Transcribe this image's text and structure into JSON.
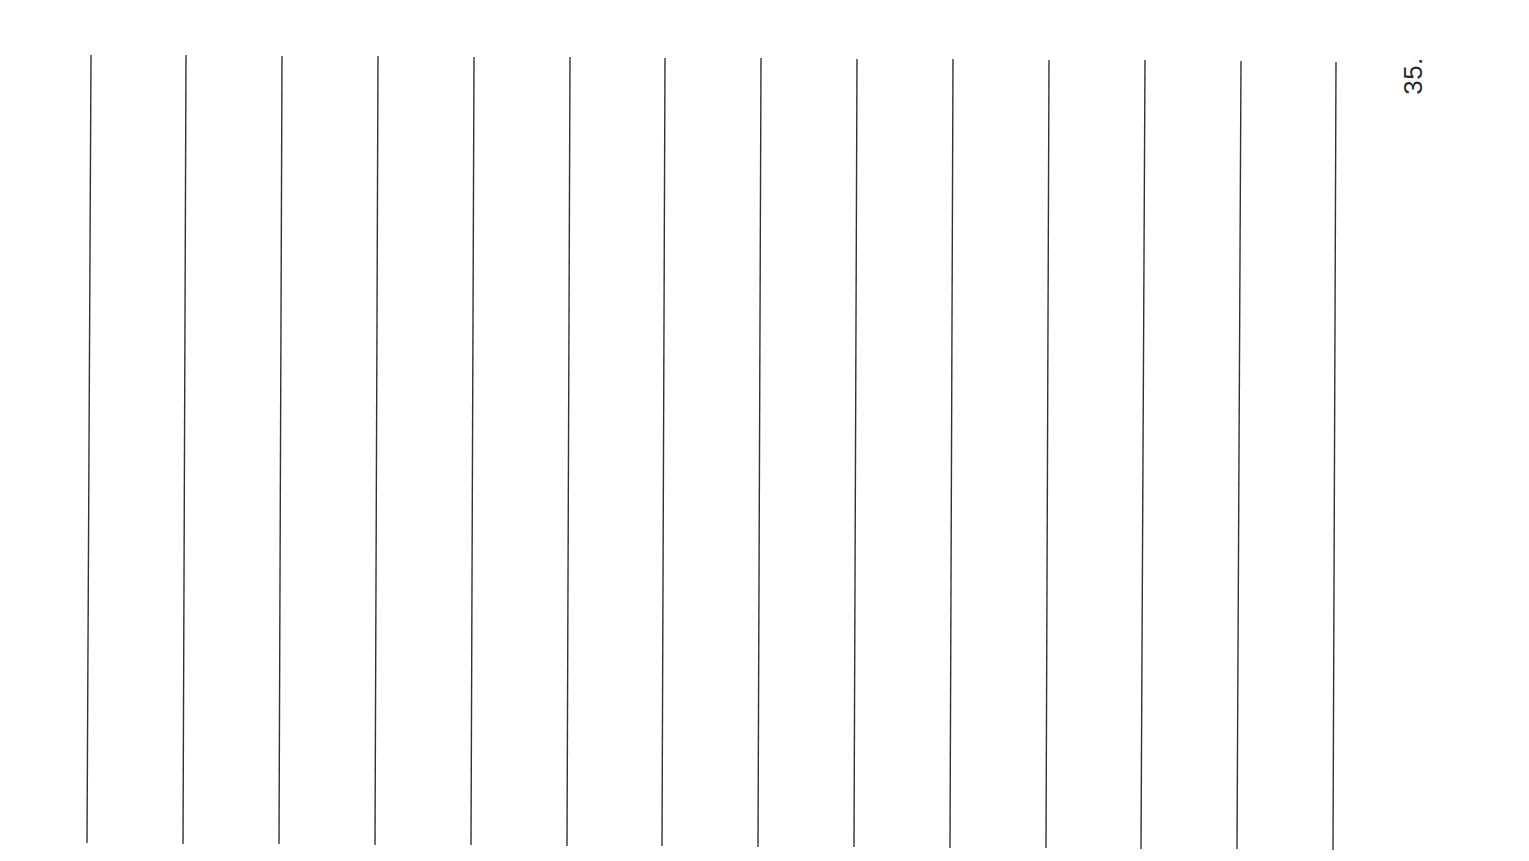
{
  "page": {
    "page_number": "35.",
    "orientation": "rotated-90-ccw",
    "background_color": "#ffffff",
    "line_color": "#333333"
  },
  "ruled_lines": [
    {
      "x1": 91,
      "y1": 55,
      "x2": 87,
      "y2": 843
    },
    {
      "x1": 186,
      "y1": 55,
      "x2": 183,
      "y2": 844
    },
    {
      "x1": 282,
      "y1": 56,
      "x2": 279,
      "y2": 844
    },
    {
      "x1": 378,
      "y1": 56,
      "x2": 375,
      "y2": 845
    },
    {
      "x1": 474,
      "y1": 57,
      "x2": 471,
      "y2": 845
    },
    {
      "x1": 570,
      "y1": 57,
      "x2": 567,
      "y2": 846
    },
    {
      "x1": 665,
      "y1": 58,
      "x2": 662,
      "y2": 846
    },
    {
      "x1": 761,
      "y1": 58,
      "x2": 758,
      "y2": 847
    },
    {
      "x1": 857,
      "y1": 59,
      "x2": 854,
      "y2": 847
    },
    {
      "x1": 953,
      "y1": 59,
      "x2": 950,
      "y2": 848
    },
    {
      "x1": 1049,
      "y1": 60,
      "x2": 1046,
      "y2": 848
    },
    {
      "x1": 1145,
      "y1": 60,
      "x2": 1141,
      "y2": 849
    },
    {
      "x1": 1241,
      "y1": 61,
      "x2": 1237,
      "y2": 849
    },
    {
      "x1": 1336,
      "y1": 62,
      "x2": 1333,
      "y2": 850
    }
  ]
}
